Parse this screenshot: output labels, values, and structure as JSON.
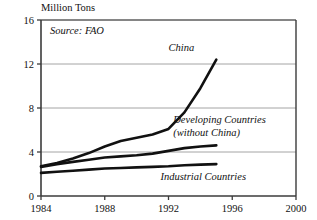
{
  "chart_data": {
    "type": "line",
    "title": "",
    "ylabel": "Million Tons",
    "xlabel": "",
    "source_note": "Source: FAO",
    "xlim": [
      1984,
      2000
    ],
    "ylim": [
      0,
      16
    ],
    "xticks": [
      1984,
      1988,
      1992,
      1996,
      2000
    ],
    "xtick_labels": [
      "1984",
      "1988",
      "1992",
      "1996",
      "2000"
    ],
    "yticks": [
      0,
      4,
      8,
      12,
      16
    ],
    "ytick_labels": [
      "0",
      "4",
      "8",
      "12",
      "16"
    ],
    "grid": "horizontal",
    "legend_position": "inline-annotations",
    "line_color": "#111111",
    "grid_color": "#9a9a9a",
    "axis_color": "#3b3b3b",
    "series": [
      {
        "name": "China",
        "label": "China",
        "label_x": 1992.0,
        "label_y": 13.2,
        "x": [
          1984,
          1985,
          1986,
          1987,
          1988,
          1989,
          1990,
          1991,
          1992,
          1993,
          1994,
          1995
        ],
        "values": [
          2.7,
          3.0,
          3.4,
          3.9,
          4.5,
          5.0,
          5.3,
          5.6,
          6.1,
          7.6,
          9.8,
          12.4
        ]
      },
      {
        "name": "Developing Countries (without China)",
        "label": "Developing Countries",
        "label2": "(without China)",
        "label_x": 1992.3,
        "label_y": 6.6,
        "x": [
          1984,
          1985,
          1986,
          1987,
          1988,
          1989,
          1990,
          1991,
          1992,
          1993,
          1994,
          1995
        ],
        "values": [
          2.65,
          2.9,
          3.1,
          3.3,
          3.5,
          3.6,
          3.7,
          3.85,
          4.1,
          4.35,
          4.5,
          4.6
        ]
      },
      {
        "name": "Industrial Countries",
        "label": "Industrial Countries",
        "label_x": 1991.5,
        "label_y": 1.5,
        "x": [
          1984,
          1985,
          1986,
          1987,
          1988,
          1989,
          1990,
          1991,
          1992,
          1993,
          1994,
          1995
        ],
        "values": [
          2.1,
          2.2,
          2.3,
          2.4,
          2.5,
          2.55,
          2.6,
          2.65,
          2.7,
          2.8,
          2.85,
          2.9
        ]
      }
    ]
  }
}
